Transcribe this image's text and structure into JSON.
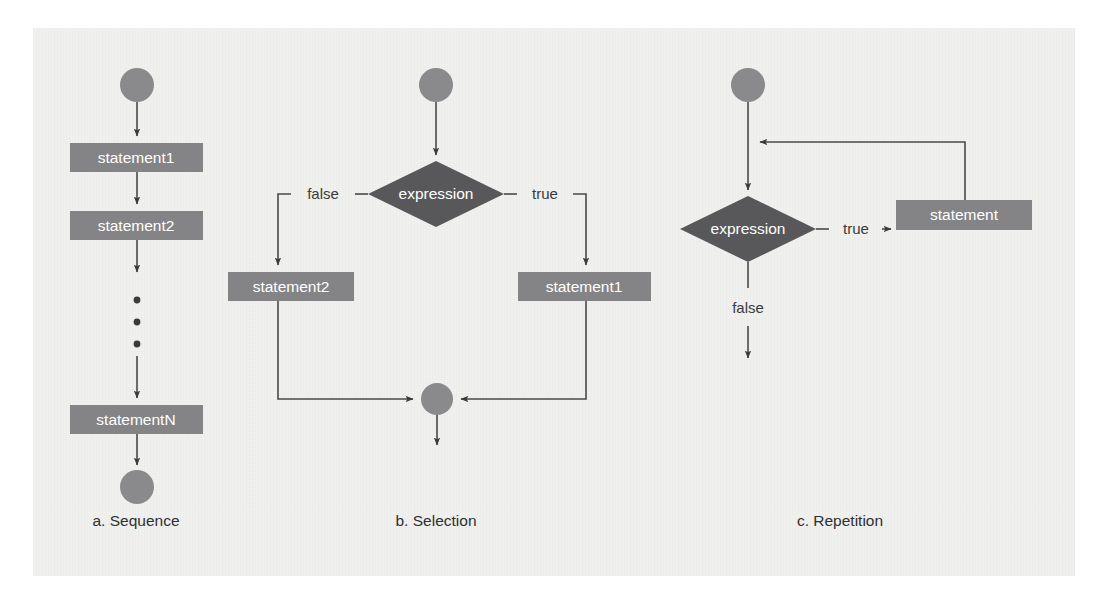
{
  "figure": {
    "background_color": "#f1f1ef",
    "shape_fill_box": "#848486",
    "shape_fill_diamond": "#58585a",
    "shape_fill_circle": "#8a8a8c",
    "line_color": "#4a4a4c",
    "shape_text_color": "#ffffff",
    "label_text_color": "#3b3b3d"
  },
  "panels": [
    {
      "id": "sequence",
      "caption": "a. Sequence",
      "nodes": [
        {
          "kind": "start-circle",
          "label": ""
        },
        {
          "kind": "process-box",
          "label": "statement1"
        },
        {
          "kind": "process-box",
          "label": "statement2"
        },
        {
          "kind": "ellipsis",
          "label": "• • •"
        },
        {
          "kind": "process-box",
          "label": "statementN"
        },
        {
          "kind": "end-circle",
          "label": ""
        }
      ],
      "edge_labels": []
    },
    {
      "id": "selection",
      "caption": "b. Selection",
      "nodes": [
        {
          "kind": "start-circle",
          "label": ""
        },
        {
          "kind": "decision-diamond",
          "label": "expression"
        },
        {
          "kind": "process-box",
          "label": "statement2"
        },
        {
          "kind": "process-box",
          "label": "statement1"
        },
        {
          "kind": "merge-circle",
          "label": ""
        }
      ],
      "edge_labels": [
        "false",
        "true"
      ]
    },
    {
      "id": "repetition",
      "caption": "c. Repetition",
      "nodes": [
        {
          "kind": "start-circle",
          "label": ""
        },
        {
          "kind": "decision-diamond",
          "label": "expression"
        },
        {
          "kind": "process-box",
          "label": "statement"
        }
      ],
      "edge_labels": [
        "true",
        "false"
      ]
    }
  ],
  "text": {
    "seq_stmt1": "statement1",
    "seq_stmt2": "statement2",
    "seq_stmtN": "statementN",
    "seq_caption": "a. Sequence",
    "sel_expression": "expression",
    "sel_false": "false",
    "sel_true": "true",
    "sel_stmt2": "statement2",
    "sel_stmt1": "statement1",
    "sel_caption": "b. Selection",
    "rep_expression": "expression",
    "rep_true": "true",
    "rep_false": "false",
    "rep_stmt": "statement",
    "rep_caption": "c. Repetition"
  }
}
